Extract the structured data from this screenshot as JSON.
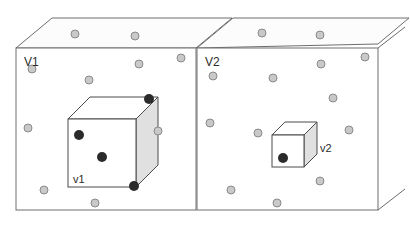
{
  "figure": {
    "background_color": "#ffffff",
    "line_color": "#6e6e6e",
    "point_light_fill": "#c9c9c9",
    "point_light_stroke": "#8a8a8a",
    "point_dark_fill": "#2b2b2b",
    "face_front_fill": "#ffffff",
    "face_top_fill": "#fcfcfc",
    "face_side_fill": "#e0e0e0"
  },
  "labels": {
    "volume_left": "V1",
    "volume_right": "V2",
    "subvolume_left": "v1",
    "subvolume_right": "v2"
  },
  "chart_data": {
    "type": "scatter",
    "xlabel": "",
    "ylabel": "",
    "legend": [
      {
        "name": "point outside sub-volume",
        "marker": "light-gray-circle"
      },
      {
        "name": "point inside sub-volume",
        "marker": "dark-circle"
      }
    ],
    "panels": [
      {
        "name": "V1",
        "label": "V1",
        "subvolume_label": "v1",
        "front_face": {
          "x": 16,
          "y": 48,
          "w": 180,
          "h": 162
        },
        "depth": {
          "dx": 36,
          "dy": -30
        },
        "subvolume": {
          "front_face": {
            "x": 68,
            "y": 119,
            "w": 68,
            "h": 68
          },
          "depth": {
            "dx": 22,
            "dy": -22
          }
        },
        "points_light": [
          {
            "x": 75,
            "y": 14,
            "r": 4
          },
          {
            "x": 135,
            "y": 24,
            "r": 4
          },
          {
            "x": 181,
            "y": 58,
            "r": 4
          },
          {
            "x": 139,
            "y": 64,
            "r": 4
          },
          {
            "x": 32,
            "y": 69,
            "r": 4
          },
          {
            "x": 89,
            "y": 80,
            "r": 4
          },
          {
            "x": 28,
            "y": 128,
            "r": 4
          },
          {
            "x": 146,
            "y": 130,
            "r": 4
          },
          {
            "x": 44,
            "y": 190,
            "r": 4
          },
          {
            "x": 95,
            "y": 203,
            "r": 4
          }
        ],
        "points_dark": [
          {
            "x": 79,
            "y": 135,
            "r": 5
          },
          {
            "x": 102,
            "y": 157,
            "r": 5
          },
          {
            "x": 149,
            "y": 99,
            "r": 5
          },
          {
            "x": 134,
            "y": 186,
            "r": 5
          }
        ]
      },
      {
        "name": "V2",
        "label": "V2",
        "subvolume_label": "v2",
        "front_face": {
          "x": 197,
          "y": 48,
          "w": 181,
          "h": 162
        },
        "depth": {
          "dx": 36,
          "dy": -30
        },
        "subvolume": {
          "front_face": {
            "x": 272,
            "y": 135,
            "w": 32,
            "h": 32
          },
          "depth": {
            "dx": 13,
            "dy": -13
          }
        },
        "points_light": [
          {
            "x": 262,
            "y": 31,
            "r": 4
          },
          {
            "x": 320,
            "y": 34,
            "r": 4
          },
          {
            "x": 365,
            "y": 57,
            "r": 4
          },
          {
            "x": 321,
            "y": 64,
            "r": 4
          },
          {
            "x": 213,
            "y": 76,
            "r": 4
          },
          {
            "x": 273,
            "y": 78,
            "r": 4
          },
          {
            "x": 333,
            "y": 98,
            "r": 4
          },
          {
            "x": 210,
            "y": 123,
            "r": 4
          },
          {
            "x": 258,
            "y": 133,
            "r": 4
          },
          {
            "x": 349,
            "y": 130,
            "r": 4
          },
          {
            "x": 320,
            "y": 181,
            "r": 4
          },
          {
            "x": 231,
            "y": 190,
            "r": 4
          },
          {
            "x": 277,
            "y": 203,
            "r": 4
          }
        ],
        "points_dark": [
          {
            "x": 283,
            "y": 158,
            "r": 5
          }
        ]
      }
    ]
  }
}
